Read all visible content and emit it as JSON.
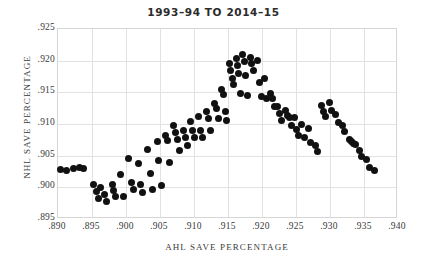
{
  "chart_data": {
    "type": "scatter",
    "title": "1993–94 TO 2014–15",
    "xlabel": "AHL SAVE PERCENTAGE",
    "ylabel": "NHL SAVE PERCENTAGE",
    "xlim": [
      0.89,
      0.94
    ],
    "ylim": [
      0.895,
      0.925
    ],
    "xticks": [
      0.89,
      0.895,
      0.9,
      0.905,
      0.91,
      0.915,
      0.92,
      0.925,
      0.93,
      0.935,
      0.94
    ],
    "yticks": [
      0.895,
      0.9,
      0.905,
      0.91,
      0.915,
      0.92,
      0.925
    ],
    "xticklabels": [
      ".890",
      ".895",
      ".900",
      ".905",
      ".910",
      ".915",
      ".920",
      ".925",
      ".930",
      ".935",
      ".940"
    ],
    "yticklabels": [
      ".895",
      ".900",
      ".905",
      ".910",
      ".915",
      ".920",
      ".925"
    ],
    "grid": true,
    "legend": "none",
    "marker_color": "#111111",
    "grid_color": "#e2e2e2",
    "frame_color": "#d6d6d6",
    "points": [
      [
        0.8903,
        0.9028
      ],
      [
        0.8913,
        0.9027
      ],
      [
        0.8923,
        0.9029
      ],
      [
        0.8931,
        0.9031
      ],
      [
        0.8938,
        0.903
      ],
      [
        0.8952,
        0.9005
      ],
      [
        0.8956,
        0.8993
      ],
      [
        0.8959,
        0.8983
      ],
      [
        0.8963,
        0.9
      ],
      [
        0.8968,
        0.8988
      ],
      [
        0.8972,
        0.8978
      ],
      [
        0.898,
        0.9005
      ],
      [
        0.8982,
        0.8995
      ],
      [
        0.8985,
        0.8986
      ],
      [
        0.8992,
        0.9021
      ],
      [
        0.8996,
        0.8986
      ],
      [
        0.9004,
        0.9046
      ],
      [
        0.9008,
        0.9008
      ],
      [
        0.9011,
        0.8996
      ],
      [
        0.9018,
        0.9038
      ],
      [
        0.9021,
        0.9005
      ],
      [
        0.9024,
        0.8992
      ],
      [
        0.9032,
        0.9059
      ],
      [
        0.9036,
        0.9022
      ],
      [
        0.9039,
        0.8997
      ],
      [
        0.9046,
        0.9072
      ],
      [
        0.9048,
        0.9043
      ],
      [
        0.9052,
        0.9003
      ],
      [
        0.9058,
        0.9082
      ],
      [
        0.9061,
        0.9074
      ],
      [
        0.9064,
        0.904
      ],
      [
        0.907,
        0.9098
      ],
      [
        0.9073,
        0.9086
      ],
      [
        0.9076,
        0.9075
      ],
      [
        0.9078,
        0.9058
      ],
      [
        0.9084,
        0.909
      ],
      [
        0.9087,
        0.9078
      ],
      [
        0.909,
        0.9066
      ],
      [
        0.9095,
        0.9104
      ],
      [
        0.9098,
        0.909
      ],
      [
        0.9101,
        0.9078
      ],
      [
        0.9106,
        0.9112
      ],
      [
        0.911,
        0.909
      ],
      [
        0.9113,
        0.9079
      ],
      [
        0.9118,
        0.912
      ],
      [
        0.9121,
        0.9108
      ],
      [
        0.9124,
        0.909
      ],
      [
        0.913,
        0.9133
      ],
      [
        0.9133,
        0.9124
      ],
      [
        0.9136,
        0.9108
      ],
      [
        0.9141,
        0.9155
      ],
      [
        0.9143,
        0.9146
      ],
      [
        0.9146,
        0.912
      ],
      [
        0.9148,
        0.9106
      ],
      [
        0.9152,
        0.9196
      ],
      [
        0.9154,
        0.9185
      ],
      [
        0.9156,
        0.9172
      ],
      [
        0.9158,
        0.9163
      ],
      [
        0.9162,
        0.9203
      ],
      [
        0.9164,
        0.9192
      ],
      [
        0.9166,
        0.918
      ],
      [
        0.9168,
        0.9148
      ],
      [
        0.9172,
        0.921
      ],
      [
        0.9174,
        0.9199
      ],
      [
        0.9176,
        0.9176
      ],
      [
        0.9178,
        0.9145
      ],
      [
        0.9183,
        0.9205
      ],
      [
        0.9185,
        0.9195
      ],
      [
        0.9188,
        0.9184
      ],
      [
        0.9193,
        0.92
      ],
      [
        0.9196,
        0.9165
      ],
      [
        0.9199,
        0.9144
      ],
      [
        0.9204,
        0.9172
      ],
      [
        0.9207,
        0.9141
      ],
      [
        0.9212,
        0.9148
      ],
      [
        0.9215,
        0.914
      ],
      [
        0.9218,
        0.9128
      ],
      [
        0.9223,
        0.9128
      ],
      [
        0.9226,
        0.9117
      ],
      [
        0.9229,
        0.9106
      ],
      [
        0.9234,
        0.9121
      ],
      [
        0.9237,
        0.9114
      ],
      [
        0.924,
        0.911
      ],
      [
        0.9243,
        0.9098
      ],
      [
        0.9248,
        0.911
      ],
      [
        0.9251,
        0.9092
      ],
      [
        0.9254,
        0.9082
      ],
      [
        0.9258,
        0.91
      ],
      [
        0.9262,
        0.9078
      ],
      [
        0.9268,
        0.9093
      ],
      [
        0.9272,
        0.9071
      ],
      [
        0.9278,
        0.9066
      ],
      [
        0.9282,
        0.9057
      ],
      [
        0.9288,
        0.913
      ],
      [
        0.9291,
        0.912
      ],
      [
        0.9294,
        0.9112
      ],
      [
        0.9299,
        0.9134
      ],
      [
        0.9302,
        0.9122
      ],
      [
        0.9308,
        0.9115
      ],
      [
        0.9312,
        0.9103
      ],
      [
        0.9318,
        0.9097
      ],
      [
        0.9322,
        0.9088
      ],
      [
        0.9328,
        0.9076
      ],
      [
        0.9331,
        0.9072
      ],
      [
        0.9334,
        0.907
      ],
      [
        0.9337,
        0.9068
      ],
      [
        0.9343,
        0.9058
      ],
      [
        0.9347,
        0.9049
      ],
      [
        0.9353,
        0.9044
      ],
      [
        0.9358,
        0.9032
      ],
      [
        0.9366,
        0.9026
      ]
    ]
  }
}
